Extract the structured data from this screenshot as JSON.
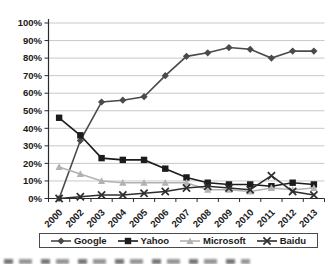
{
  "chart_data": {
    "type": "line",
    "title": "",
    "xlabel": "",
    "ylabel": "",
    "categories": [
      "2000",
      "2002",
      "2003",
      "2004",
      "2005",
      "2006",
      "2007",
      "2008",
      "2009",
      "2010",
      "2011",
      "2012",
      "2013"
    ],
    "series": [
      {
        "name": "Google",
        "marker": "diamond",
        "color": "#4a4a4a",
        "values": [
          0,
          33,
          55,
          56,
          58,
          70,
          81,
          83,
          86,
          85,
          80,
          84,
          84
        ]
      },
      {
        "name": "Yahoo",
        "marker": "square",
        "color": "#1c1c1c",
        "values": [
          46,
          36,
          23,
          22,
          22,
          17,
          12,
          9,
          8,
          8,
          7,
          9,
          8
        ]
      },
      {
        "name": "Microsoft",
        "marker": "triangle",
        "color": "#b2b2b2",
        "values": [
          18,
          14,
          10,
          9,
          9,
          9,
          9,
          5,
          5,
          4,
          6,
          5,
          6
        ]
      },
      {
        "name": "Baidu",
        "marker": "x",
        "color": "#2e2e2e",
        "values": [
          0,
          1,
          2,
          2,
          3,
          4,
          6,
          7,
          6,
          5,
          13,
          4,
          2
        ]
      }
    ],
    "ylim": [
      0,
      100
    ],
    "ytick_step": 10,
    "yticklabels": [
      "0%",
      "10%",
      "20%",
      "30%",
      "40%",
      "50%",
      "60%",
      "70%",
      "80%",
      "90%",
      "100%"
    ],
    "grid": true,
    "legend_position": "bottom"
  },
  "colors": {
    "gridline": "#c9c9c9",
    "axis": "#2b2b2b",
    "tick_text": "#1a1a1a",
    "legend_border": "#4a4a4a",
    "background": "#ffffff"
  }
}
